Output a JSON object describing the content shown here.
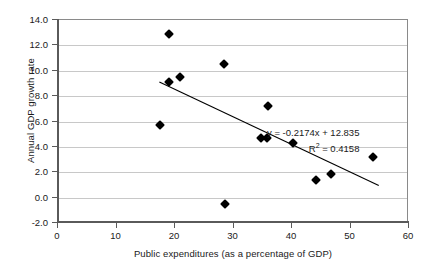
{
  "chart_data": {
    "type": "scatter",
    "title": "",
    "xlabel": "Public expenditures (as a percentage of GDP)",
    "ylabel": "Annual GDP growth rate",
    "xlim": [
      0,
      60
    ],
    "ylim": [
      -2.0,
      14.0
    ],
    "xticks": [
      "0",
      "10",
      "20",
      "30",
      "40",
      "50",
      "60"
    ],
    "xtick_values": [
      0,
      10,
      20,
      30,
      40,
      50,
      60
    ],
    "yticks": [
      "-2.0",
      "0.0",
      "2.0",
      "4.0",
      "6.0",
      "8.0",
      "10.0",
      "12.0",
      "14.0"
    ],
    "ytick_values": [
      -2.0,
      0.0,
      2.0,
      4.0,
      6.0,
      8.0,
      10.0,
      12.0,
      14.0
    ],
    "grid": "horizontal",
    "legend": "none",
    "marker": "diamond",
    "marker_color": "#000000",
    "points": [
      {
        "x": 17.5,
        "y": 5.7
      },
      {
        "x": 19.0,
        "y": 12.9
      },
      {
        "x": 19.0,
        "y": 9.1
      },
      {
        "x": 20.9,
        "y": 9.5
      },
      {
        "x": 28.4,
        "y": 10.5
      },
      {
        "x": 28.5,
        "y": -0.5
      },
      {
        "x": 35.9,
        "y": 7.2
      },
      {
        "x": 34.7,
        "y": 4.7
      },
      {
        "x": 35.7,
        "y": 4.7
      },
      {
        "x": 40.2,
        "y": 4.3
      },
      {
        "x": 44.1,
        "y": 1.4
      },
      {
        "x": 46.6,
        "y": 1.9
      },
      {
        "x": 53.8,
        "y": 3.2
      }
    ],
    "trendline": {
      "equation": "y = -0.2174x + 12.835",
      "r_squared_label": "R",
      "r_squared_sup": "2",
      "r_squared_value": " = 0.4158",
      "slope": -0.2174,
      "intercept": 12.835,
      "r_squared": 0.4158,
      "x_start": 17.5,
      "x_end": 55.0,
      "color": "#000000"
    },
    "annotations": [
      "y = -0.2174x + 12.835",
      "R2 = 0.4158"
    ]
  },
  "style": {
    "grid_color": "#c8c8c8",
    "axis_color": "#5a5a5a",
    "frame_color": "#8a8a8a",
    "text_color": "#1a1a1a",
    "background": "#ffffff"
  }
}
